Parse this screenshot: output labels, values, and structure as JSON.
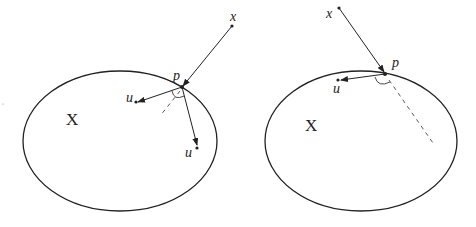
{
  "figures": [
    {
      "id": "left",
      "set_label": "X",
      "point_labels": {
        "x": "x",
        "p": "p",
        "u1": "u",
        "u2": "u"
      }
    },
    {
      "id": "right",
      "set_label": "X",
      "point_labels": {
        "x": "x",
        "p": "p",
        "u": "u"
      }
    }
  ],
  "colors": {
    "stroke": "#222222",
    "background": "#ffffff"
  }
}
